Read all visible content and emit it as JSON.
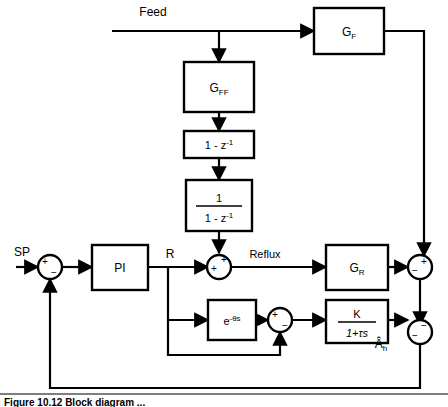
{
  "figure": {
    "caption": "Figure 10.12   Block diagram ...",
    "type": "control-system-block-diagram"
  },
  "signals": {
    "feed": "Feed",
    "sp": "SP",
    "r": "R",
    "reflux": "Reflux",
    "output": "Â",
    "output_sub": "h"
  },
  "blocks": [
    {
      "id": "gf",
      "label": "G",
      "sub": "F",
      "label2": "",
      "kind": "plain"
    },
    {
      "id": "gff",
      "label": "G",
      "sub": "FF",
      "label2": "",
      "kind": "plain"
    },
    {
      "id": "diff",
      "label": "1 - z",
      "sup": "-1",
      "kind": "super"
    },
    {
      "id": "integ_n",
      "label": "1",
      "kind": "fraction-num"
    },
    {
      "id": "integ_d",
      "label": "1 - z",
      "sup": "-1",
      "kind": "fraction-den"
    },
    {
      "id": "pi",
      "label": "PI",
      "kind": "plain"
    },
    {
      "id": "gr",
      "label": "G",
      "sub": "R",
      "kind": "plain"
    },
    {
      "id": "delay",
      "label": "e",
      "sup": "-θs",
      "kind": "super"
    },
    {
      "id": "lag_n",
      "label": "K",
      "kind": "fraction-num"
    },
    {
      "id": "lag_d",
      "label": "1+τs",
      "kind": "fraction-den"
    }
  ],
  "summers": [
    {
      "id": "sum-sp",
      "signs": [
        "+",
        "−"
      ]
    },
    {
      "id": "sum-reflux",
      "signs": [
        "+",
        "+"
      ]
    },
    {
      "id": "sum-model",
      "signs": [
        "+",
        "−"
      ]
    },
    {
      "id": "sum-right-1",
      "signs": [
        "+",
        "−"
      ]
    },
    {
      "id": "sum-right-2",
      "signs": [
        "−",
        "−"
      ]
    }
  ],
  "colors": {
    "line": "#000000",
    "background": "#ffffff",
    "text": "#000000"
  }
}
